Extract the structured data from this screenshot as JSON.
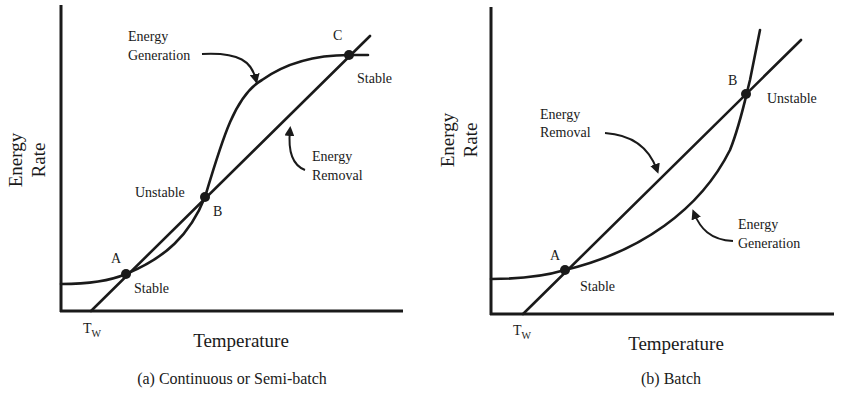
{
  "panels": [
    {
      "id": "a",
      "caption": "(a)  Continuous or Semi-batch",
      "xlabel": "Temperature",
      "ylabel_line1": "Energy",
      "ylabel_line2": "Rate",
      "tw_label": "T",
      "tw_sub": "W",
      "curves": [
        {
          "name": "Energy Generation",
          "label_line1": "Energy",
          "label_line2": "Generation",
          "shape": "sigmoid"
        },
        {
          "name": "Energy Removal",
          "label_line1": "Energy",
          "label_line2": "Removal",
          "shape": "linear"
        }
      ],
      "points": [
        {
          "name": "A",
          "state": "Stable"
        },
        {
          "name": "B",
          "state": "Unstable"
        },
        {
          "name": "C",
          "state": "Stable"
        }
      ]
    },
    {
      "id": "b",
      "caption": "(b)  Batch",
      "xlabel": "Temperature",
      "ylabel_line1": "Energy",
      "ylabel_line2": "Rate",
      "tw_label": "T",
      "tw_sub": "W",
      "curves": [
        {
          "name": "Energy Removal",
          "label_line1": "Energy",
          "label_line2": "Removal",
          "shape": "linear"
        },
        {
          "name": "Energy Generation",
          "label_line1": "Energy",
          "label_line2": "Generation",
          "shape": "exponential"
        }
      ],
      "points": [
        {
          "name": "A",
          "state": "Stable"
        },
        {
          "name": "B",
          "state": "Unstable"
        }
      ]
    }
  ],
  "colors": {
    "ink": "#1a1a1a",
    "background": "#ffffff"
  }
}
